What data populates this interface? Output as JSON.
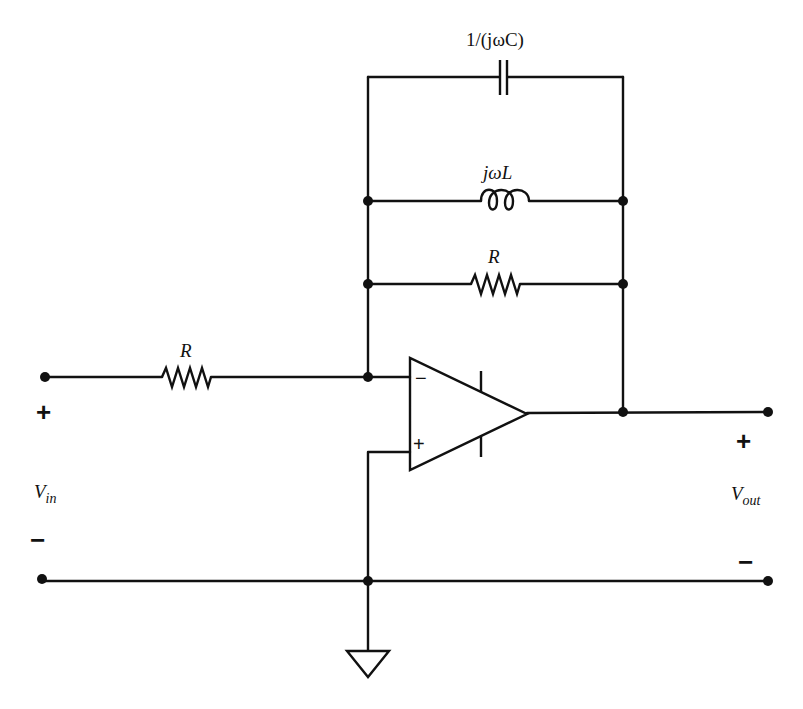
{
  "diagram": {
    "type": "circuit-schematic",
    "components": {
      "capacitor": {
        "label": "1/(jωC)"
      },
      "inductor": {
        "label": "jωL"
      },
      "feedback_resistor": {
        "label": "R"
      },
      "input_resistor": {
        "label": "R"
      },
      "opamp": {
        "inverting_sign": "−",
        "noninverting_sign": "+"
      }
    },
    "terminals": {
      "input": {
        "plus": "+",
        "minus": "−",
        "voltage_main": "V",
        "voltage_sub": "in"
      },
      "output": {
        "plus": "+",
        "minus": "−",
        "voltage_main": "V",
        "voltage_sub": "out"
      }
    },
    "ground": {
      "symbol": "ground-triangle"
    },
    "colors": {
      "ink": "#111111",
      "background": "#ffffff"
    }
  }
}
